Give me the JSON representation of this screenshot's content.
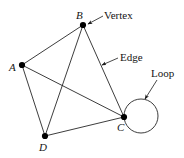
{
  "figure": {
    "type": "graph-diagram",
    "background_color": "#ffffff",
    "stroke_color": "#1a1a1a",
    "vertex_fill_color": "#000000",
    "width": 184,
    "height": 158
  },
  "vertices": [
    {
      "id": "A",
      "label": "A",
      "x": 22,
      "y": 65,
      "label_x": 9,
      "label_y": 62,
      "r": 3.1
    },
    {
      "id": "B",
      "label": "B",
      "x": 83,
      "y": 25,
      "label_x": 76,
      "label_y": 10,
      "r": 3.1
    },
    {
      "id": "C",
      "label": "C",
      "x": 124,
      "y": 117,
      "label_x": 117,
      "label_y": 122,
      "r": 3.1
    },
    {
      "id": "D",
      "label": "D",
      "x": 45,
      "y": 136,
      "label_x": 39,
      "label_y": 142,
      "r": 3.1
    }
  ],
  "edges": [
    {
      "from": "A",
      "to": "B"
    },
    {
      "from": "A",
      "to": "C"
    },
    {
      "from": "A",
      "to": "D"
    },
    {
      "from": "B",
      "to": "C"
    },
    {
      "from": "B",
      "to": "D"
    },
    {
      "from": "D",
      "to": "C"
    }
  ],
  "loop": {
    "at_vertex": "C",
    "center_x": 141,
    "center_y": 116,
    "radius": 17
  },
  "annotations": [
    {
      "id": "vertex",
      "label": "Vertex",
      "label_x": 104,
      "label_y": 10,
      "arrow_from_x": 103,
      "arrow_from_y": 16,
      "arrow_to_x": 88,
      "arrow_to_y": 24
    },
    {
      "id": "edge",
      "label": "Edge",
      "label_x": 120,
      "label_y": 52,
      "arrow_from_x": 118,
      "arrow_from_y": 58,
      "arrow_to_x": 102,
      "arrow_to_y": 65
    },
    {
      "id": "loop",
      "label": "Loop",
      "label_x": 151,
      "label_y": 68,
      "arrow_from_x": 157,
      "arrow_from_y": 80,
      "arrow_to_x": 145,
      "arrow_to_y": 99
    }
  ]
}
